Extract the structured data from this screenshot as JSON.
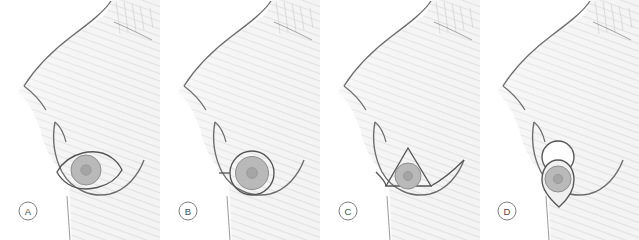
{
  "figure": {
    "panel_count": 4,
    "background_color": "#ffffff",
    "skin_fill": "#f1f1f1",
    "skin_stroke": "#6e6e6e",
    "marking_stroke": "#555555",
    "areola_fill": "#b4b4b4",
    "areola_stroke": "#8a8a8a",
    "nipple_fill": "#9a9a9a",
    "label_stroke": "#808080",
    "label_text_color": "#4a4a4a",
    "hatch_color": "#dcdcdc"
  },
  "panels": [
    {
      "id": "a",
      "label": "A",
      "incision_name": "elliptical-lens-incision",
      "description": "Horizontal lens / ellipse shaped incision marking encircling the nipple areola complex",
      "marking_shape": "ellipse-lens"
    },
    {
      "id": "b",
      "label": "B",
      "incision_name": "periareolar-circular-incision",
      "description": "Circular periareolar incision marking with short lateral tail extension",
      "marking_shape": "circle-with-tail"
    },
    {
      "id": "c",
      "label": "C",
      "incision_name": "triangular-wedge-incision",
      "description": "Triangular wedge marking with apex above the nipple and inframammary fold line",
      "marking_shape": "triangle-with-fold-line"
    },
    {
      "id": "d",
      "label": "D",
      "incision_name": "keyhole-wise-pattern-incision",
      "description": "Keyhole pattern: upper circle with teardrop limb descending to a point below the nipple",
      "marking_shape": "keyhole"
    }
  ]
}
